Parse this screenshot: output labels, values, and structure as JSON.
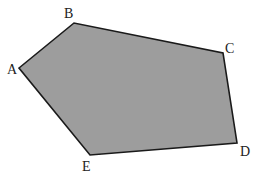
{
  "diagram": {
    "type": "pentagon",
    "colors": {
      "fill": "#9d9d9d",
      "stroke": "#1a1a1a",
      "label": "#222222"
    },
    "vertices": [
      {
        "name": "A",
        "x": 19,
        "y": 68,
        "label_x": 7,
        "label_y": 74
      },
      {
        "name": "B",
        "x": 74,
        "y": 23,
        "label_x": 64,
        "label_y": 18
      },
      {
        "name": "C",
        "x": 223,
        "y": 53,
        "label_x": 225,
        "label_y": 53
      },
      {
        "name": "D",
        "x": 237,
        "y": 143,
        "label_x": 240,
        "label_y": 156
      },
      {
        "name": "E",
        "x": 90,
        "y": 155,
        "label_x": 82,
        "label_y": 171
      }
    ]
  }
}
